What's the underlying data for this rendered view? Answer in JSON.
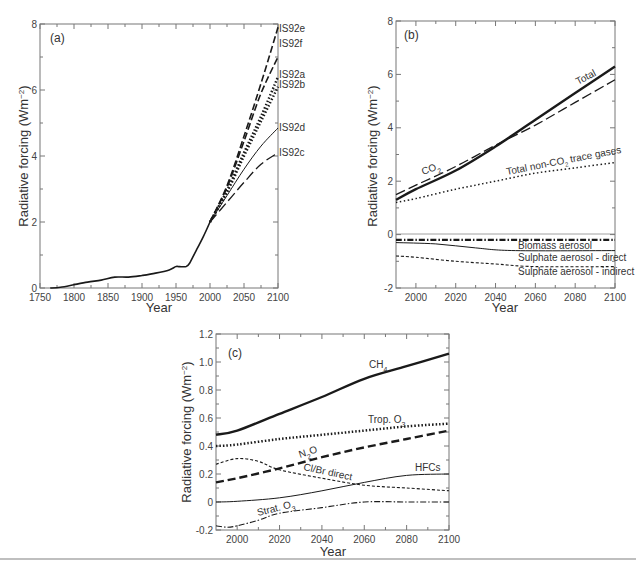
{
  "chart_data": [
    {
      "type": "line",
      "panel_label": "(a)",
      "title": "",
      "xlabel": "Year",
      "ylabel": "Radiative forcing (Wm−2)",
      "xlim": [
        1750,
        2100
      ],
      "ylim": [
        0,
        8
      ],
      "xticks": [
        1750,
        1800,
        1850,
        1900,
        1950,
        2000,
        2050,
        2100
      ],
      "yticks": [
        0,
        2,
        4,
        6,
        8
      ],
      "grid": false,
      "legend": "direct labels at right edge",
      "series": [
        {
          "name": "Historical",
          "style": "solid",
          "x": [
            1765,
            1780,
            1800,
            1820,
            1840,
            1860,
            1880,
            1900,
            1920,
            1940,
            1950,
            1955,
            1965,
            1970,
            1980,
            1990,
            2000
          ],
          "y": [
            0.0,
            0.02,
            0.1,
            0.18,
            0.24,
            0.33,
            0.33,
            0.38,
            0.45,
            0.55,
            0.65,
            0.65,
            0.65,
            0.75,
            1.15,
            1.55,
            2.0
          ]
        },
        {
          "name": "IS92e",
          "style": "dashed",
          "x": [
            2000,
            2025,
            2050,
            2075,
            2100
          ],
          "y": [
            2.0,
            3.1,
            4.6,
            6.2,
            7.9
          ]
        },
        {
          "name": "IS92f",
          "style": "dashed",
          "x": [
            2000,
            2025,
            2050,
            2075,
            2100
          ],
          "y": [
            2.0,
            3.05,
            4.45,
            5.9,
            7.0
          ]
        },
        {
          "name": "IS92a",
          "style": "dotted-heavy",
          "x": [
            2000,
            2025,
            2050,
            2075,
            2100
          ],
          "y": [
            2.0,
            2.95,
            4.1,
            5.2,
            6.4
          ]
        },
        {
          "name": "IS92b",
          "style": "dotted-heavy",
          "x": [
            2000,
            2025,
            2050,
            2075,
            2100
          ],
          "y": [
            2.0,
            2.9,
            4.0,
            5.05,
            6.1
          ]
        },
        {
          "name": "IS92d",
          "style": "solid-thin",
          "x": [
            2000,
            2025,
            2050,
            2075,
            2100
          ],
          "y": [
            2.0,
            2.8,
            3.6,
            4.3,
            4.85
          ]
        },
        {
          "name": "IS92c",
          "style": "long-dash",
          "x": [
            2000,
            2025,
            2050,
            2075,
            2100
          ],
          "y": [
            2.0,
            2.6,
            3.2,
            3.75,
            4.1
          ]
        }
      ]
    },
    {
      "type": "line",
      "panel_label": "(b)",
      "title": "",
      "xlabel": "Year",
      "ylabel": "Radiative forcing (Wm−2)",
      "xlim": [
        1990,
        2100
      ],
      "ylim": [
        -2,
        8
      ],
      "xticks": [
        2000,
        2020,
        2040,
        2060,
        2080,
        2100
      ],
      "yticks": [
        -2,
        0,
        2,
        4,
        6,
        8
      ],
      "grid": false,
      "legend": "inline annotations",
      "series": [
        {
          "name": "Total",
          "style": "solid-heavy",
          "x": [
            1990,
            2000,
            2020,
            2040,
            2060,
            2080,
            2100
          ],
          "y": [
            1.3,
            1.7,
            2.4,
            3.3,
            4.3,
            5.3,
            6.3
          ]
        },
        {
          "name": "CO2",
          "style": "long-dash",
          "x": [
            1990,
            2000,
            2020,
            2040,
            2060,
            2080,
            2100
          ],
          "y": [
            1.5,
            1.85,
            2.55,
            3.35,
            4.1,
            4.95,
            5.8
          ]
        },
        {
          "name": "Total non-CO2 trace gases",
          "style": "dotted",
          "x": [
            1990,
            2000,
            2020,
            2040,
            2060,
            2080,
            2100
          ],
          "y": [
            1.2,
            1.35,
            1.7,
            2.0,
            2.3,
            2.5,
            2.7
          ]
        },
        {
          "name": "Biomass aerosol",
          "style": "dash-dot-heavy",
          "x": [
            1990,
            2100
          ],
          "y": [
            -0.2,
            -0.2
          ]
        },
        {
          "name": "Sulphate aerosol - direct",
          "style": "solid-thin",
          "x": [
            1990,
            2010,
            2030,
            2050,
            2100
          ],
          "y": [
            -0.3,
            -0.35,
            -0.5,
            -0.6,
            -0.6
          ]
        },
        {
          "name": "Sulphate aerosol - indirect",
          "style": "short-dash",
          "x": [
            1990,
            2000,
            2020,
            2040,
            2060,
            2100
          ],
          "y": [
            -0.8,
            -0.85,
            -1.0,
            -1.1,
            -1.2,
            -1.2
          ]
        }
      ]
    },
    {
      "type": "line",
      "panel_label": "(c)",
      "title": "",
      "xlabel": "Year",
      "ylabel": "Radiative forcing (Wm−2)",
      "xlim": [
        1990,
        2100
      ],
      "ylim": [
        -0.2,
        1.2
      ],
      "xticks": [
        2000,
        2020,
        2040,
        2060,
        2080,
        2100
      ],
      "yticks": [
        -0.2,
        0,
        0.2,
        0.4,
        0.6,
        0.8,
        1.0,
        1.2
      ],
      "grid": false,
      "legend": "inline annotations",
      "series": [
        {
          "name": "CH4",
          "style": "solid-heavy",
          "x": [
            1990,
            2000,
            2020,
            2040,
            2060,
            2080,
            2100
          ],
          "y": [
            0.48,
            0.51,
            0.63,
            0.75,
            0.88,
            0.97,
            1.06
          ]
        },
        {
          "name": "Trop. O3",
          "style": "dotted-heavy",
          "x": [
            1990,
            2000,
            2020,
            2040,
            2060,
            2080,
            2100
          ],
          "y": [
            0.4,
            0.41,
            0.45,
            0.48,
            0.51,
            0.54,
            0.56
          ]
        },
        {
          "name": "N2O",
          "style": "dashed-heavy",
          "x": [
            1990,
            2000,
            2020,
            2040,
            2060,
            2080,
            2100
          ],
          "y": [
            0.14,
            0.17,
            0.24,
            0.32,
            0.39,
            0.45,
            0.51
          ]
        },
        {
          "name": "Cl/Br direct",
          "style": "short-dash",
          "x": [
            1990,
            2000,
            2010,
            2020,
            2040,
            2060,
            2080,
            2100
          ],
          "y": [
            0.27,
            0.31,
            0.29,
            0.23,
            0.17,
            0.12,
            0.1,
            0.08
          ]
        },
        {
          "name": "HFCs",
          "style": "solid-thin",
          "x": [
            1990,
            2000,
            2020,
            2040,
            2060,
            2080,
            2100
          ],
          "y": [
            0.0,
            0.005,
            0.03,
            0.08,
            0.14,
            0.19,
            0.2
          ]
        },
        {
          "name": "Strat. O3",
          "style": "dash-dot",
          "x": [
            1990,
            1995,
            2000,
            2010,
            2020,
            2040,
            2060,
            2080,
            2100
          ],
          "y": [
            -0.17,
            -0.18,
            -0.17,
            -0.13,
            -0.08,
            -0.04,
            0.0,
            0.0,
            0.0
          ]
        }
      ]
    }
  ],
  "labels": {
    "a": {
      "panel": "(a)",
      "xlabel": "Year",
      "ylabel": "Radiative forcing (Wm",
      "ylabel_sup": "−2",
      "ylabel_end": ")",
      "xticks": [
        "1750",
        "1800",
        "1850",
        "1900",
        "1950",
        "2000",
        "2050",
        "2100"
      ],
      "yticks": [
        "0",
        "2",
        "4",
        "6",
        "8"
      ],
      "series_labels": [
        "IS92e",
        "IS92f",
        "IS92a",
        "IS92b",
        "IS92d",
        "IS92c"
      ]
    },
    "b": {
      "panel": "(b)",
      "xlabel": "Year",
      "ylabel": "Radiative forcing (Wm",
      "ylabel_sup": "−2",
      "ylabel_end": ")",
      "xticks": [
        "2000",
        "2020",
        "2040",
        "2060",
        "2080",
        "2100"
      ],
      "yticks": [
        "-2",
        "0",
        "2",
        "4",
        "6",
        "8"
      ],
      "total": "Total",
      "co2": "CO",
      "co2_sub": "2",
      "nonco2_a": "Total non-CO",
      "nonco2_sub": "2",
      "nonco2_b": " trace gases",
      "biomass": "Biomass aerosol",
      "sulph_direct": "Sulphate aerosol - direct",
      "sulph_indirect": "Sulphate aerosol - indirect"
    },
    "c": {
      "panel": "(c)",
      "xlabel": "Year",
      "ylabel": "Radiative forcing (Wm",
      "ylabel_sup": "−2",
      "ylabel_end": ")",
      "xticks": [
        "2000",
        "2020",
        "2040",
        "2060",
        "2080",
        "2100"
      ],
      "yticks": [
        "-0.2",
        "0",
        "0.2",
        "0.4",
        "0.6",
        "0.8",
        "1.0",
        "1.2"
      ],
      "ch4": "CH",
      "ch4_sub": "4",
      "trop": "Trop. O",
      "trop_sub": "3",
      "n2o_a": "N",
      "n2o_sub": "2",
      "n2o_b": "O",
      "clbr": "Cl/Br direct",
      "hfcs": "HFCs",
      "strat": "Strat. O",
      "strat_sub": "3"
    }
  }
}
